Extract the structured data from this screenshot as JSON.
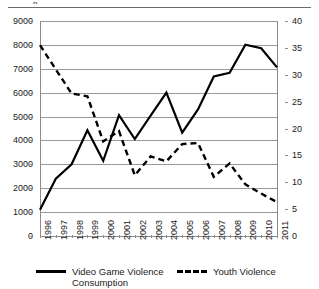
{
  "chart_data": {
    "type": "line",
    "title": "",
    "xlabel": "",
    "ylabel": "",
    "grid": true,
    "legend_position": "bottom",
    "categories": [
      "1996",
      "1997",
      "1998",
      "1999",
      "2000",
      "2001",
      "2002",
      "2003",
      "2004",
      "2005",
      "2006",
      "2007",
      "2008",
      "2009",
      "2010",
      "2011"
    ],
    "axes": {
      "left": {
        "label": "",
        "ylim": [
          0,
          9000
        ],
        "ticks": [
          0,
          1000,
          2000,
          3000,
          4000,
          5000,
          6000,
          7000,
          8000,
          9000
        ],
        "tick_labels": [
          "0",
          "1000",
          "2000",
          "3000",
          "4000",
          "5000",
          "6000",
          "7000",
          "8000",
          "9000"
        ]
      },
      "right": {
        "label": "",
        "ylim": [
          0,
          40
        ],
        "ticks": [
          0,
          5,
          10,
          15,
          20,
          25,
          30,
          35,
          40
        ],
        "tick_labels": [
          "0",
          "5",
          "10",
          "15",
          "20",
          "25",
          "30",
          "35",
          "40"
        ]
      }
    },
    "series": [
      {
        "name": "Video Game Violence Consumption",
        "legend_label": "Video Game Violence\nConsumption",
        "axis": "left",
        "style": "solid",
        "color": "#000000",
        "values": [
          1100,
          2400,
          3000,
          4430,
          3150,
          5060,
          4060,
          5040,
          6000,
          4330,
          5300,
          6680,
          6830,
          8010,
          7860,
          7060
        ]
      },
      {
        "name": "Youth Violence",
        "legend_label": "Youth Violence",
        "axis": "right",
        "style": "dashed",
        "color": "#000000",
        "values": [
          35.5,
          31.0,
          26.5,
          26.0,
          17.6,
          19.5,
          11.3,
          14.8,
          13.9,
          17.1,
          17.3,
          11.0,
          13.5,
          9.6,
          7.9,
          6.3
        ]
      }
    ]
  },
  "figure": {
    "top_rule": true,
    "top_descender": "p"
  }
}
